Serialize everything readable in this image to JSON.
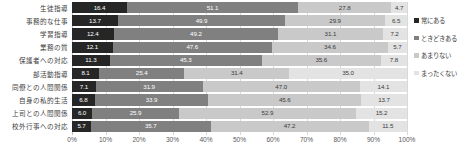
{
  "chart_data": {
    "type": "bar",
    "orientation": "horizontal",
    "stacked": true,
    "stack_mode": "percent",
    "title": "",
    "xlabel": "",
    "ylabel": "",
    "xlim": [
      0,
      100
    ],
    "xticks": [
      "0%",
      "10%",
      "20%",
      "30%",
      "40%",
      "50%",
      "60%",
      "70%",
      "80%",
      "90%",
      "100%"
    ],
    "xtick_values": [
      0,
      10,
      20,
      30,
      40,
      50,
      60,
      70,
      80,
      90,
      100
    ],
    "grid": true,
    "legend_position": "right",
    "categories": [
      "生徒指導",
      "事務的な仕事",
      "学習指導",
      "業務の質",
      "保護者への対応",
      "部活動指導",
      "同僚との人間関係",
      "自身の私的生活",
      "上司との人間関係",
      "校外行事への対応"
    ],
    "series": [
      {
        "name": "常にある",
        "color": "#262626",
        "values": [
          16.4,
          13.7,
          12.4,
          12.1,
          11.3,
          8.1,
          7.1,
          6.8,
          6.0,
          5.7
        ]
      },
      {
        "name": "ときどきある",
        "color": "#808080",
        "values": [
          51.1,
          49.9,
          49.2,
          47.6,
          45.3,
          25.4,
          31.9,
          33.9,
          25.9,
          35.7
        ]
      },
      {
        "name": "あまりない",
        "color": "#c9c9c9",
        "values": [
          27.8,
          29.9,
          31.1,
          34.6,
          35.6,
          31.4,
          47.0,
          45.6,
          52.9,
          47.2
        ]
      },
      {
        "name": "まったくない",
        "color": "#e3e3e3",
        "values": [
          4.7,
          6.5,
          7.2,
          5.7,
          7.8,
          35.0,
          14.1,
          13.7,
          15.2,
          11.5
        ]
      }
    ]
  }
}
